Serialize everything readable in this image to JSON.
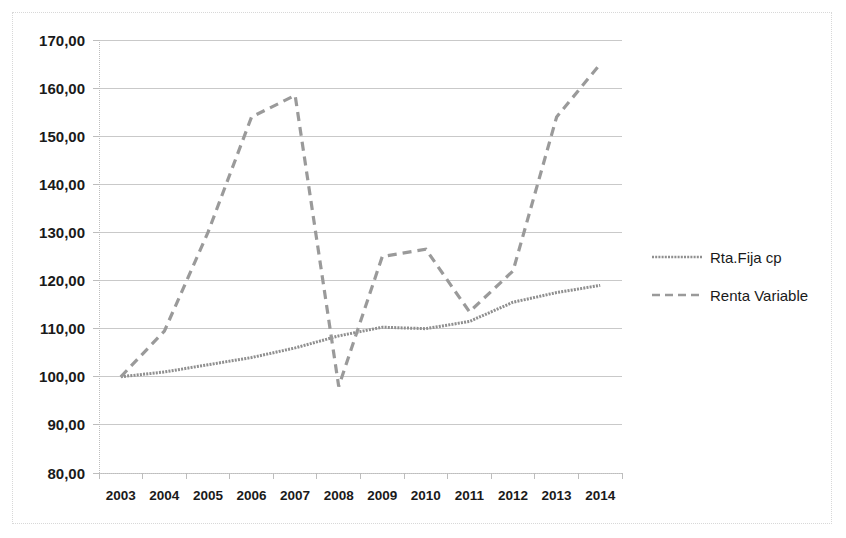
{
  "chart_data": {
    "type": "line",
    "title": "",
    "subtitle": "",
    "xlabel": "",
    "ylabel": "",
    "x": [
      "2003",
      "2004",
      "2005",
      "2006",
      "2007",
      "2008",
      "2009",
      "2010",
      "2011",
      "2012",
      "2013",
      "2014"
    ],
    "categories": [
      "2003",
      "2004",
      "2005",
      "2006",
      "2007",
      "2008",
      "2009",
      "2010",
      "2011",
      "2012",
      "2013",
      "2014"
    ],
    "ylim": [
      80,
      170
    ],
    "yticks": [
      80,
      90,
      100,
      110,
      120,
      130,
      140,
      150,
      160,
      170
    ],
    "ytick_labels": [
      "80,00",
      "90,00",
      "100,00",
      "110,00",
      "120,00",
      "130,00",
      "140,00",
      "150,00",
      "160,00",
      "170,00"
    ],
    "grid": true,
    "grid_axis": "y",
    "legend_position": "right",
    "series": [
      {
        "name": "Rta.Fija cp",
        "style": "fine-dotted",
        "color": "#8f8f8f",
        "values": [
          100.0,
          101.0,
          102.5,
          104.0,
          106.0,
          108.5,
          110.3,
          110.0,
          111.5,
          115.5,
          117.5,
          119.0
        ]
      },
      {
        "name": "Renta Variable",
        "style": "dashed",
        "color": "#9a9a9a",
        "values": [
          100.0,
          109.5,
          130.0,
          154.0,
          158.5,
          98.0,
          125.0,
          126.5,
          113.5,
          122.0,
          154.0,
          165.0
        ]
      }
    ]
  },
  "legend": {
    "items": [
      {
        "label": "Rta.Fija cp",
        "marker": "fine-dotted-line-icon"
      },
      {
        "label": "Renta Variable",
        "marker": "dashed-line-icon"
      }
    ]
  },
  "colors": {
    "series_rta_fija": "#8f8f8f",
    "series_renta_variable": "#9a9a9a",
    "gridline": "#c9c9c9",
    "axis": "#bdbdbd",
    "text": "#1a1a1a",
    "border": "#d8d8d8",
    "background": "#ffffff"
  }
}
